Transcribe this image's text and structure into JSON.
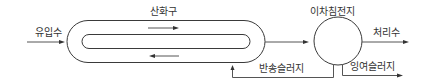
{
  "diagram": {
    "type": "oxidation ditch process flow",
    "labels": {
      "influent": "유입수",
      "oxidation_ditch": "산화구",
      "secondary_clarifier": "이차침전지",
      "effluent": "처리수",
      "return_sludge": "반송슬러지",
      "waste_sludge": "잉여슬러지"
    },
    "nodes": [
      {
        "id": "oxidation_ditch",
        "label": "산화구",
        "shape": "racetrack"
      },
      {
        "id": "secondary_clarifier",
        "label": "이차침전지",
        "shape": "circle"
      }
    ],
    "edges": [
      {
        "from": "influent",
        "to": "oxidation_ditch",
        "label": "유입수"
      },
      {
        "from": "oxidation_ditch",
        "to": "secondary_clarifier",
        "label": ""
      },
      {
        "from": "secondary_clarifier",
        "to": "effluent",
        "label": "처리수"
      },
      {
        "from": "secondary_clarifier",
        "to": "oxidation_ditch",
        "label": "반송슬러지"
      },
      {
        "from": "secondary_clarifier",
        "to": "waste",
        "label": "잉여슬러지"
      }
    ],
    "internal_flow": [
      "clockwise: top channel rightward",
      "bottom channel leftward"
    ]
  }
}
